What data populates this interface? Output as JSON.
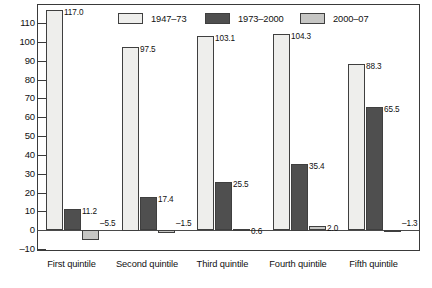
{
  "chart_data": {
    "type": "bar",
    "title": "",
    "subtitle": "",
    "xlabel": "",
    "ylabel": "",
    "categories": [
      "First quintile",
      "Second quintile",
      "Third quintile",
      "Fourth quintile",
      "Fifth quintile"
    ],
    "series": [
      {
        "name": "1947–73",
        "color": "#eeeeec",
        "values": [
          117.0,
          97.5,
          103.1,
          104.3,
          88.3
        ],
        "labels": [
          "117.0",
          "97.5",
          "103.1",
          "104.3",
          "88.3"
        ]
      },
      {
        "name": "1973–2000",
        "color": "#4f4f4f",
        "values": [
          11.2,
          17.4,
          25.5,
          35.4,
          65.5
        ],
        "labels": [
          "11.2",
          "17.4",
          "25.5",
          "35.4",
          "65.5"
        ]
      },
      {
        "name": "2000–07",
        "color": "#c6c6c4",
        "values": [
          -5.5,
          -1.5,
          0.6,
          2.0,
          -1.3
        ],
        "labels": [
          "–5.5",
          "–1.5",
          "0.6",
          "2.0",
          "–1.3"
        ]
      }
    ],
    "ylim": [
      -10,
      118
    ],
    "yticks": [
      -10,
      0,
      10,
      20,
      30,
      40,
      50,
      60,
      70,
      80,
      90,
      100,
      110
    ],
    "ytick_labels": [
      "–10",
      "0",
      "10",
      "20",
      "30",
      "40",
      "50",
      "60",
      "70",
      "80",
      "90",
      "100",
      "110"
    ],
    "grid": false,
    "legend_position": "top-inside",
    "frame": true,
    "zero_line": true
  },
  "legend": {
    "entries": [
      {
        "label": "1947–73"
      },
      {
        "label": "1973–2000"
      },
      {
        "label": "2000–07"
      }
    ]
  }
}
